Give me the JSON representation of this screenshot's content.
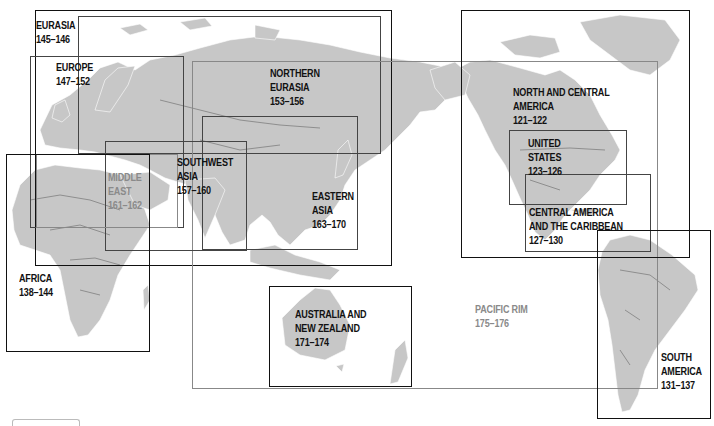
{
  "map": {
    "title": "World regional map index",
    "land_color": "#c7c7c7",
    "frame_color": "#111111",
    "regions": [
      {
        "id": "eurasia",
        "lines": [
          "EURASIA",
          "145–146"
        ],
        "pages": "145–146"
      },
      {
        "id": "europe",
        "lines": [
          "EUROPE",
          "147–152"
        ],
        "pages": "147–152"
      },
      {
        "id": "northern-eurasia",
        "lines": [
          "NORTHERN",
          "EURASIA",
          "153–156"
        ],
        "pages": "153–156"
      },
      {
        "id": "southwest-asia",
        "lines": [
          "SOUTHWEST",
          "ASIA",
          "157–160"
        ],
        "pages": "157–160"
      },
      {
        "id": "middle-east",
        "lines": [
          "MIDDLE",
          "EAST",
          "161–162"
        ],
        "pages": "161–162"
      },
      {
        "id": "eastern-asia",
        "lines": [
          "EASTERN",
          "ASIA",
          "163–170"
        ],
        "pages": "163–170"
      },
      {
        "id": "africa",
        "lines": [
          "AFRICA",
          "138–144"
        ],
        "pages": "138–144"
      },
      {
        "id": "australia-nz",
        "lines": [
          "AUSTRALIA AND",
          "NEW ZEALAND",
          "171–174"
        ],
        "pages": "171–174"
      },
      {
        "id": "pacific-rim",
        "lines": [
          "PACIFIC RIM",
          "175–176"
        ],
        "pages": "175–176"
      },
      {
        "id": "north-central-america",
        "lines": [
          "NORTH AND CENTRAL",
          "AMERICA",
          "121–122"
        ],
        "pages": "121–122"
      },
      {
        "id": "united-states",
        "lines": [
          "UNITED",
          "STATES",
          "123–126"
        ],
        "pages": "123–126"
      },
      {
        "id": "central-america-caribbean",
        "lines": [
          "CENTRAL AMERICA",
          "AND THE CARIBBEAN",
          "127–130"
        ],
        "pages": "127–130"
      },
      {
        "id": "south-america",
        "lines": [
          "SOUTH",
          "AMERICA",
          "131–137"
        ],
        "pages": "131–137"
      }
    ]
  }
}
